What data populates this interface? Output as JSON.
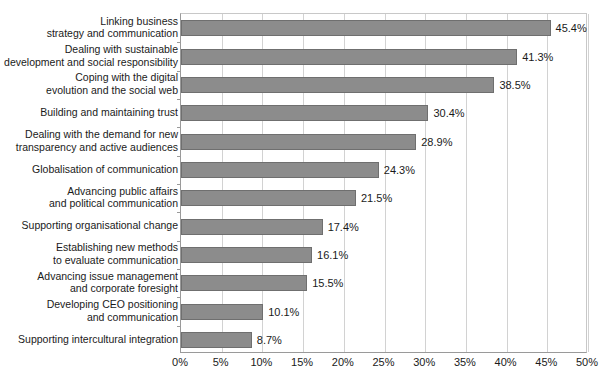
{
  "chart_data": {
    "type": "bar",
    "orientation": "horizontal",
    "title": "",
    "subtitle": "",
    "xlabel": "",
    "ylabel": "",
    "xlim": [
      0,
      50
    ],
    "xticks": [
      0,
      5,
      10,
      15,
      20,
      25,
      30,
      35,
      40,
      45,
      50
    ],
    "xtick_labels": [
      "0%",
      "5%",
      "10%",
      "15%",
      "20%",
      "25%",
      "30%",
      "35%",
      "40%",
      "45%",
      "50%"
    ],
    "grid": "vertical",
    "legend": "none",
    "value_suffix": "%",
    "bar_color": "#8c8c8c",
    "bar_edge_color": "#6f6f6f",
    "gridline_color": "#d2d2d2",
    "axis_color": "#9a9a9a",
    "categories": [
      "Linking business\nstrategy and communication",
      "Dealing with sustainable\ndevelopment and social responsibility",
      "Coping with the digital\nevolution and the social web",
      "Building and maintaining trust",
      "Dealing with the demand for new\ntransparency and active audiences",
      "Globalisation of communication",
      "Advancing public affairs\nand political communication",
      "Supporting organisational change",
      "Establishing new methods\nto evaluate communication",
      "Advancing issue management\nand corporate foresight",
      "Developing CEO positioning\nand communication",
      "Supporting intercultural integration"
    ],
    "values": [
      45.4,
      41.3,
      38.5,
      30.4,
      28.9,
      24.3,
      21.5,
      17.4,
      16.1,
      15.5,
      10.1,
      8.7
    ],
    "value_labels": [
      "45.4%",
      "41.3%",
      "38.5%",
      "30.4%",
      "28.9%",
      "24.3%",
      "21.5%",
      "17.4%",
      "16.1%",
      "15.5%",
      "10.1%",
      "8.7%"
    ]
  }
}
